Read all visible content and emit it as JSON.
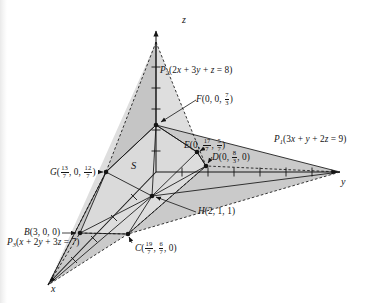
{
  "figure": {
    "name": "feasible-region-three-planes",
    "background_color": "#ffffff",
    "ink_color": "#141414",
    "fill_light": "#d7d7d7",
    "fill_mid": "#c2c2c2",
    "fill_dark": "#ababab"
  },
  "axes": [
    {
      "id": "z",
      "label": "z",
      "direction": "up"
    },
    {
      "id": "y",
      "label": "y",
      "direction": "right"
    },
    {
      "id": "x",
      "label": "x",
      "direction": "down-left"
    }
  ],
  "region": {
    "label": "S",
    "name": "solution-region"
  },
  "planes": [
    {
      "id": "P1",
      "symbol": "P",
      "subscript": "1",
      "equation": "3x + y + 2z = 9",
      "label": "P₁(3x + y + 2z = 9)"
    },
    {
      "id": "P2",
      "symbol": "P",
      "subscript": "2",
      "equation": "2x + 3y + z = 8",
      "label": "P₂(2x + 3y + z = 8)"
    },
    {
      "id": "P3",
      "symbol": "P",
      "subscript": "3",
      "equation": "x + 2y + 3z = 7",
      "label": "P₃(x + 2y + 3z = 7)"
    }
  ],
  "points": [
    {
      "id": "B",
      "letter": "B",
      "coords_text": "(3, 0, 0)",
      "parts": [
        {
          "type": "int",
          "value": "3"
        },
        {
          "type": "int",
          "value": "0"
        },
        {
          "type": "int",
          "value": "0"
        }
      ]
    },
    {
      "id": "C",
      "letter": "C",
      "coords_text": "(19/7, 6/7, 0)",
      "parts": [
        {
          "type": "frac",
          "num": "19",
          "den": "7"
        },
        {
          "type": "frac",
          "num": "6",
          "den": "7"
        },
        {
          "type": "int",
          "value": "0"
        }
      ]
    },
    {
      "id": "D",
      "letter": "D",
      "coords_text": "(0, 8/3, 0)",
      "parts": [
        {
          "type": "int",
          "value": "0"
        },
        {
          "type": "frac",
          "num": "8",
          "den": "3"
        },
        {
          "type": "int",
          "value": "0"
        }
      ]
    },
    {
      "id": "E",
      "letter": "E",
      "coords_text": "(0, 17/7, 5/7)",
      "parts": [
        {
          "type": "int",
          "value": "0"
        },
        {
          "type": "frac",
          "num": "17",
          "den": "7"
        },
        {
          "type": "frac",
          "num": "5",
          "den": "7"
        }
      ]
    },
    {
      "id": "F",
      "letter": "F",
      "coords_text": "(0, 0, 7/3)",
      "parts": [
        {
          "type": "int",
          "value": "0"
        },
        {
          "type": "int",
          "value": "0"
        },
        {
          "type": "frac",
          "num": "7",
          "den": "3"
        }
      ]
    },
    {
      "id": "G",
      "letter": "G",
      "coords_text": "(13/7, 0, 12/7)",
      "parts": [
        {
          "type": "frac",
          "num": "13",
          "den": "7"
        },
        {
          "type": "int",
          "value": "0"
        },
        {
          "type": "frac",
          "num": "12",
          "den": "7"
        }
      ]
    },
    {
      "id": "H",
      "letter": "H",
      "coords_text": "(2, 1, 1)",
      "parts": [
        {
          "type": "int",
          "value": "2"
        },
        {
          "type": "int",
          "value": "1"
        },
        {
          "type": "int",
          "value": "1"
        }
      ]
    }
  ],
  "labels": {
    "P2": "P₂(2x + 3y + z = 8)",
    "P1": "P₁(3x + y + 2z = 9)",
    "P3": "P₃(x + 2y + 3z = 7)",
    "F": "F(0, 0, 7/3)",
    "E": "E(0, 17/7, 5/7)",
    "D": "D(0, 8/3, 0)",
    "G": "G(13/7, 0, 12/7)",
    "B": "B(3, 0, 0)",
    "C": "C(19/7, 6/7, 0)",
    "H": "H(2, 1, 1)",
    "S": "S",
    "axis_x": "x",
    "axis_y": "y",
    "axis_z": "z"
  }
}
